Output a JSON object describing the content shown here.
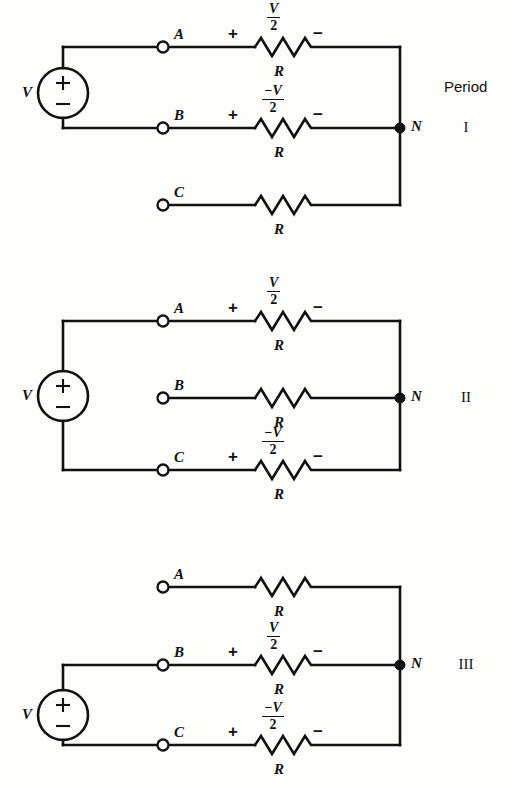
{
  "figure": {
    "type": "circuit-diagram",
    "background": "#fdfdfb",
    "ink_color": "#111111",
    "period_header": "Period"
  },
  "circuits": [
    {
      "id": "circuit-1",
      "period_label": "I",
      "source_label": "V",
      "source_plus": "+",
      "source_minus": "−",
      "node_label": "N",
      "source_connects": [
        "A",
        "B"
      ],
      "rows": [
        {
          "terminal": "A",
          "resistor_label": "R",
          "has_polarity": true,
          "plus": "+",
          "minus": "−",
          "drop_numerator": "V",
          "drop_denominator": "2",
          "drop_text": "V/2"
        },
        {
          "terminal": "B",
          "resistor_label": "R",
          "has_polarity": true,
          "plus": "+",
          "minus": "−",
          "drop_numerator": "−V",
          "drop_denominator": "2",
          "drop_text": "-V/2"
        },
        {
          "terminal": "C",
          "resistor_label": "R",
          "has_polarity": false,
          "plus": "",
          "minus": "",
          "drop_numerator": "",
          "drop_denominator": "",
          "drop_text": ""
        }
      ]
    },
    {
      "id": "circuit-2",
      "period_label": "II",
      "source_label": "V",
      "source_plus": "+",
      "source_minus": "−",
      "node_label": "N",
      "source_connects": [
        "A",
        "C"
      ],
      "rows": [
        {
          "terminal": "A",
          "resistor_label": "R",
          "has_polarity": true,
          "plus": "+",
          "minus": "−",
          "drop_numerator": "V",
          "drop_denominator": "2",
          "drop_text": "V/2"
        },
        {
          "terminal": "B",
          "resistor_label": "R",
          "has_polarity": false,
          "plus": "",
          "minus": "",
          "drop_numerator": "",
          "drop_denominator": "",
          "drop_text": ""
        },
        {
          "terminal": "C",
          "resistor_label": "R",
          "has_polarity": true,
          "plus": "+",
          "minus": "−",
          "drop_numerator": "−V",
          "drop_denominator": "2",
          "drop_text": "-V/2"
        }
      ]
    },
    {
      "id": "circuit-3",
      "period_label": "III",
      "source_label": "V",
      "source_plus": "+",
      "source_minus": "−",
      "node_label": "N",
      "source_connects": [
        "B",
        "C"
      ],
      "rows": [
        {
          "terminal": "A",
          "resistor_label": "R",
          "has_polarity": false,
          "plus": "",
          "minus": "",
          "drop_numerator": "",
          "drop_denominator": "",
          "drop_text": ""
        },
        {
          "terminal": "B",
          "resistor_label": "R",
          "has_polarity": true,
          "plus": "+",
          "minus": "−",
          "drop_numerator": "V",
          "drop_denominator": "2",
          "drop_text": "V/2"
        },
        {
          "terminal": "C",
          "resistor_label": "R",
          "has_polarity": true,
          "plus": "+",
          "minus": "−",
          "drop_numerator": "−V",
          "drop_denominator": "2",
          "drop_text": "-V/2"
        }
      ]
    }
  ]
}
